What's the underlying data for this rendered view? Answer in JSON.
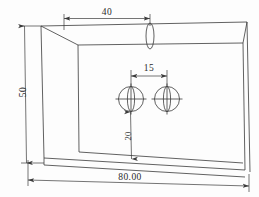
{
  "drawing": {
    "title": "Isometric part drawing with two holes",
    "background_color": "#fdfdfd",
    "line_color": "#3a3a3a",
    "text_color": "#2b2b2b",
    "projection": "oblique-isometric",
    "units_note": "",
    "body": {
      "name": "rectangular-plate-with-side-wall",
      "description": "Box-like plate shown in oblique projection with a left side wall panel, sloped top edge, chamfered right edge and visible bottom edge thickness"
    },
    "features": [
      {
        "name": "hole-left",
        "type": "circle-with-centerlines",
        "label": ""
      },
      {
        "name": "hole-right",
        "type": "circle-with-centerlines",
        "label": ""
      },
      {
        "name": "top-slot-ellipse",
        "type": "ellipse",
        "label": ""
      }
    ],
    "dimensions": [
      {
        "name": "dim-top-40",
        "value": "40",
        "orientation": "horizontal",
        "position": "top",
        "description": "Distance from left edge of top face to slot feature"
      },
      {
        "name": "dim-left-50",
        "value": "50",
        "orientation": "vertical-rotated",
        "position": "left",
        "description": "Overall height of the part"
      },
      {
        "name": "dim-holes-15",
        "value": "15",
        "orientation": "horizontal",
        "position": "middle",
        "description": "Center to center distance between the two holes"
      },
      {
        "name": "dim-hole-bottom-20",
        "value": "20",
        "orientation": "vertical-rotated",
        "position": "middle",
        "description": "Distance from left hole center down to bottom edge"
      },
      {
        "name": "dim-bottom-80",
        "value": "80.00",
        "orientation": "horizontal",
        "position": "bottom",
        "description": "Overall width of the part"
      }
    ]
  }
}
